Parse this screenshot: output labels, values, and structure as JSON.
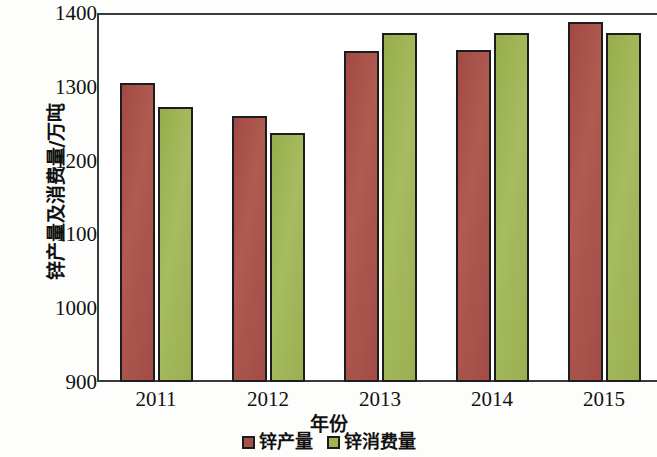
{
  "chart_data": {
    "type": "bar",
    "title": "",
    "xlabel": "年份",
    "ylabel": "锌产量及消费量/万吨",
    "categories": [
      "2011",
      "2012",
      "2013",
      "2014",
      "2015"
    ],
    "ylim": [
      900,
      1400
    ],
    "yticks": [
      900,
      1000,
      1100,
      1200,
      1300,
      1400
    ],
    "ytick_labels": [
      "900",
      "1000",
      "1100",
      "1200",
      "1300",
      "1400"
    ],
    "grid": false,
    "legend_position": "bottom-center",
    "series": [
      {
        "name": "锌产量",
        "color": "#a8514a",
        "values": [
          1305,
          1261,
          1349,
          1350,
          1388
        ]
      },
      {
        "name": "锌消费量",
        "color": "#9fb455",
        "values": [
          1272,
          1238,
          1373,
          1373,
          1373
        ]
      }
    ]
  },
  "legend": {
    "items": [
      {
        "label": "锌产量",
        "swatch": "production-swatch"
      },
      {
        "label": "锌消费量",
        "swatch": "consumption-swatch"
      }
    ]
  }
}
